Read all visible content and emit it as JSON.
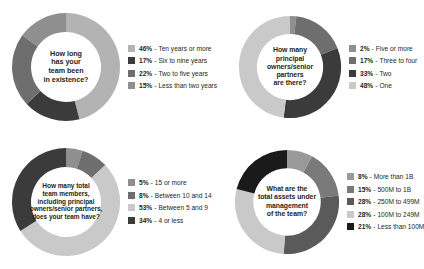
{
  "chart_data": [
    {
      "type": "pie",
      "name": "team-tenure",
      "title": "How long has your team been in existence?",
      "center_lines": [
        "How long",
        "has your",
        "team been",
        "in existence?"
      ],
      "legend_position": "right",
      "categories": [
        "Ten years or more",
        "Six to nine years",
        "Two to five years",
        "Less than two years"
      ],
      "values": [
        46,
        17,
        22,
        15
      ],
      "value_suffix": "%",
      "colors": [
        "#b3b3b3",
        "#3b3b3b",
        "#6e6e6e",
        "#8f8f8f"
      ],
      "legend": [
        {
          "pct": "46%",
          "sep": "-",
          "label": "Ten years or more",
          "color": "#b3b3b3"
        },
        {
          "pct": "17%",
          "sep": "-",
          "label": "Six to nine years",
          "color": "#3b3b3b"
        },
        {
          "pct": "22%",
          "sep": "-",
          "label": "Two to five years",
          "color": "#6e6e6e"
        },
        {
          "pct": "15%",
          "sep": "-",
          "label": "Less than two years",
          "color": "#8f8f8f"
        }
      ]
    },
    {
      "type": "pie",
      "name": "principal-owners",
      "title": "How many principal owners/senior partners are there?",
      "center_lines": [
        "How many",
        "principal",
        "owners/senior",
        "partners",
        "are there?"
      ],
      "legend_position": "right",
      "categories": [
        "Five or more",
        "Three to four",
        "Two",
        "One"
      ],
      "values": [
        2,
        17,
        33,
        48
      ],
      "value_suffix": "%",
      "colors": [
        "#8f8f8f",
        "#6e6e6e",
        "#3b3b3b",
        "#c9c9c9"
      ],
      "legend": [
        {
          "pct": "2%",
          "sep": "-",
          "label": "Five or more",
          "color": "#8f8f8f"
        },
        {
          "pct": "17%",
          "sep": "-",
          "label": "Three to four",
          "color": "#6e6e6e"
        },
        {
          "pct": "33%",
          "sep": "-",
          "label": "Two",
          "color": "#3b3b3b"
        },
        {
          "pct": "48%",
          "sep": "-",
          "label": "One",
          "color": "#c9c9c9"
        }
      ]
    },
    {
      "type": "pie",
      "name": "team-size",
      "title": "How many total team members, including principal owners/senior partners, does your team have?",
      "center_lines": [
        "How many total",
        "team members,",
        "including principal",
        "owners/senior partners,",
        "does your team have?"
      ],
      "legend_position": "right",
      "categories": [
        "15 or more",
        "Between 10 and 14",
        "Between 5 and 9",
        "4 or less"
      ],
      "values": [
        5,
        8,
        53,
        34
      ],
      "value_suffix": "%",
      "colors": [
        "#8f8f8f",
        "#6e6e6e",
        "#c9c9c9",
        "#3b3b3b"
      ],
      "legend": [
        {
          "pct": "5%",
          "sep": "-",
          "label": "15 or more",
          "color": "#8f8f8f"
        },
        {
          "pct": "8%",
          "sep": "-",
          "label": "Between 10 and 14",
          "color": "#6e6e6e"
        },
        {
          "pct": "53%",
          "sep": "-",
          "label": "Between 5 and 9",
          "color": "#c9c9c9"
        },
        {
          "pct": "34%",
          "sep": "-",
          "label": "4 or less",
          "color": "#3b3b3b"
        }
      ]
    },
    {
      "type": "pie",
      "name": "assets-under-management",
      "title": "What are the total assets under management of the team?",
      "center_lines": [
        "What are the",
        "total assets under",
        "management",
        "of the team?"
      ],
      "legend_position": "right",
      "categories": [
        "More than 1B",
        "500M to 1B",
        "250M to 499M",
        "100M to 249M",
        "Less than 100M"
      ],
      "values": [
        8,
        15,
        28,
        28,
        21
      ],
      "value_suffix": "%",
      "colors": [
        "#9a9a9a",
        "#7a7a7a",
        "#5a5a5a",
        "#c9c9c9",
        "#1a1a1a"
      ],
      "legend": [
        {
          "pct": "8%",
          "sep": "-",
          "label": "More than 1B",
          "color": "#9a9a9a"
        },
        {
          "pct": "15%",
          "sep": "-",
          "label": "500M to 1B",
          "color": "#7a7a7a"
        },
        {
          "pct": "28%",
          "sep": "-",
          "label": "250M to 499M",
          "color": "#5a5a5a"
        },
        {
          "pct": "28%",
          "sep": "-",
          "label": "100M to 249M",
          "color": "#c9c9c9"
        },
        {
          "pct": "21%",
          "sep": "-",
          "label": "Less than 100M",
          "color": "#1a1a1a"
        }
      ]
    }
  ],
  "layout": {
    "donut_size": 110,
    "donut_size_small": 104,
    "ring_thickness": 19,
    "background": "#ffffff",
    "text_color": "#231f20"
  }
}
